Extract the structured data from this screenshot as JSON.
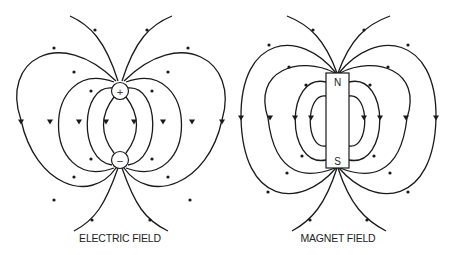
{
  "diagrams": [
    {
      "id": "electric",
      "caption": "ELECTRIC FIELD",
      "charges": [
        {
          "symbol": "+",
          "label": "positive charge"
        },
        {
          "symbol": "−",
          "label": "negative charge"
        }
      ]
    },
    {
      "id": "magnet",
      "caption": "MAGNET FIELD",
      "poles": [
        {
          "symbol": "N",
          "label": "north pole"
        },
        {
          "symbol": "S",
          "label": "south pole"
        }
      ]
    }
  ],
  "colors": {
    "line": "#1a1a1a",
    "background": "#ffffff"
  }
}
